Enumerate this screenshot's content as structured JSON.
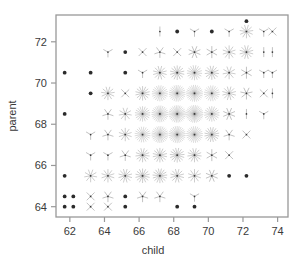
{
  "chart_data": {
    "type": "scatter",
    "variant": "sunflower-plot",
    "title": "",
    "xlabel": "child",
    "ylabel": "parent",
    "xlim": [
      61.2,
      74.6
    ],
    "ylim": [
      63.5,
      73.3
    ],
    "xticks": [
      62,
      64,
      66,
      68,
      70,
      72,
      74
    ],
    "xticklabels": [
      "62",
      "64",
      "66",
      "68",
      "70",
      "72",
      "74"
    ],
    "yticks": [
      64,
      66,
      68,
      70,
      72
    ],
    "yticklabels": [
      "64",
      "66",
      "68",
      "70",
      "72"
    ],
    "grid": false,
    "legend": null,
    "point_color": "#2b2b2b",
    "petal_color": "#8a8a8a",
    "frame_color": "#999999",
    "note": "Each location is drawn as a sunflower: count 1 = solid dot, count n>1 = n radiating petals.",
    "points": [
      {
        "x": 61.7,
        "y": 70.5,
        "count": 1
      },
      {
        "x": 61.7,
        "y": 68.5,
        "count": 1
      },
      {
        "x": 61.7,
        "y": 65.5,
        "count": 1
      },
      {
        "x": 61.7,
        "y": 64.5,
        "count": 1
      },
      {
        "x": 61.7,
        "y": 64.0,
        "count": 1
      },
      {
        "x": 62.2,
        "y": 64.5,
        "count": 1
      },
      {
        "x": 62.2,
        "y": 64.0,
        "count": 1
      },
      {
        "x": 63.2,
        "y": 70.5,
        "count": 1
      },
      {
        "x": 63.2,
        "y": 69.5,
        "count": 1
      },
      {
        "x": 63.2,
        "y": 67.5,
        "count": 3
      },
      {
        "x": 63.2,
        "y": 66.5,
        "count": 3
      },
      {
        "x": 63.2,
        "y": 65.5,
        "count": 9
      },
      {
        "x": 63.2,
        "y": 64.5,
        "count": 4
      },
      {
        "x": 63.2,
        "y": 64.0,
        "count": 4
      },
      {
        "x": 64.2,
        "y": 71.5,
        "count": 3
      },
      {
        "x": 64.2,
        "y": 69.5,
        "count": 11
      },
      {
        "x": 64.2,
        "y": 68.5,
        "count": 5
      },
      {
        "x": 64.2,
        "y": 67.5,
        "count": 5
      },
      {
        "x": 64.2,
        "y": 66.5,
        "count": 3
      },
      {
        "x": 64.2,
        "y": 65.5,
        "count": 10
      },
      {
        "x": 64.2,
        "y": 64.5,
        "count": 5
      },
      {
        "x": 64.2,
        "y": 64.0,
        "count": 4
      },
      {
        "x": 65.2,
        "y": 71.5,
        "count": 1
      },
      {
        "x": 65.2,
        "y": 70.5,
        "count": 1
      },
      {
        "x": 65.2,
        "y": 69.5,
        "count": 4
      },
      {
        "x": 65.2,
        "y": 68.5,
        "count": 9
      },
      {
        "x": 65.2,
        "y": 67.5,
        "count": 10
      },
      {
        "x": 65.2,
        "y": 66.5,
        "count": 5
      },
      {
        "x": 65.2,
        "y": 65.5,
        "count": 12
      },
      {
        "x": 65.2,
        "y": 64.5,
        "count": 1
      },
      {
        "x": 65.2,
        "y": 64.0,
        "count": 1
      },
      {
        "x": 66.2,
        "y": 71.5,
        "count": 4
      },
      {
        "x": 66.2,
        "y": 70.5,
        "count": 3
      },
      {
        "x": 66.2,
        "y": 69.5,
        "count": 14
      },
      {
        "x": 66.2,
        "y": 68.5,
        "count": 18
      },
      {
        "x": 66.2,
        "y": 67.5,
        "count": 20
      },
      {
        "x": 66.2,
        "y": 66.5,
        "count": 13
      },
      {
        "x": 66.2,
        "y": 65.5,
        "count": 14
      },
      {
        "x": 66.2,
        "y": 64.5,
        "count": 5
      },
      {
        "x": 67.2,
        "y": 72.5,
        "count": 2
      },
      {
        "x": 67.2,
        "y": 71.5,
        "count": 5
      },
      {
        "x": 67.2,
        "y": 70.5,
        "count": 12
      },
      {
        "x": 67.2,
        "y": 69.5,
        "count": 21
      },
      {
        "x": 67.2,
        "y": 68.5,
        "count": 25
      },
      {
        "x": 67.2,
        "y": 67.5,
        "count": 25
      },
      {
        "x": 67.2,
        "y": 66.5,
        "count": 14
      },
      {
        "x": 67.2,
        "y": 65.5,
        "count": 15
      },
      {
        "x": 67.2,
        "y": 64.5,
        "count": 5
      },
      {
        "x": 68.2,
        "y": 72.5,
        "count": 1
      },
      {
        "x": 68.2,
        "y": 71.5,
        "count": 4
      },
      {
        "x": 68.2,
        "y": 70.5,
        "count": 14
      },
      {
        "x": 68.2,
        "y": 69.5,
        "count": 24
      },
      {
        "x": 68.2,
        "y": 68.5,
        "count": 28
      },
      {
        "x": 68.2,
        "y": 67.5,
        "count": 26
      },
      {
        "x": 68.2,
        "y": 66.5,
        "count": 15
      },
      {
        "x": 68.2,
        "y": 65.5,
        "count": 12
      },
      {
        "x": 68.2,
        "y": 64.0,
        "count": 1
      },
      {
        "x": 69.2,
        "y": 72.5,
        "count": 3
      },
      {
        "x": 69.2,
        "y": 71.5,
        "count": 8
      },
      {
        "x": 69.2,
        "y": 70.5,
        "count": 17
      },
      {
        "x": 69.2,
        "y": 69.5,
        "count": 25
      },
      {
        "x": 69.2,
        "y": 68.5,
        "count": 29
      },
      {
        "x": 69.2,
        "y": 67.5,
        "count": 24
      },
      {
        "x": 69.2,
        "y": 66.5,
        "count": 13
      },
      {
        "x": 69.2,
        "y": 65.5,
        "count": 10
      },
      {
        "x": 69.2,
        "y": 64.5,
        "count": 3
      },
      {
        "x": 69.2,
        "y": 64.0,
        "count": 1
      },
      {
        "x": 70.2,
        "y": 72.5,
        "count": 1
      },
      {
        "x": 70.2,
        "y": 71.5,
        "count": 6
      },
      {
        "x": 70.2,
        "y": 70.5,
        "count": 13
      },
      {
        "x": 70.2,
        "y": 69.5,
        "count": 20
      },
      {
        "x": 70.2,
        "y": 68.5,
        "count": 18
      },
      {
        "x": 70.2,
        "y": 67.5,
        "count": 16
      },
      {
        "x": 70.2,
        "y": 66.5,
        "count": 6
      },
      {
        "x": 70.2,
        "y": 65.5,
        "count": 8
      },
      {
        "x": 71.2,
        "y": 72.5,
        "count": 3
      },
      {
        "x": 71.2,
        "y": 71.5,
        "count": 10
      },
      {
        "x": 71.2,
        "y": 70.5,
        "count": 9
      },
      {
        "x": 71.2,
        "y": 69.5,
        "count": 12
      },
      {
        "x": 71.2,
        "y": 68.5,
        "count": 8
      },
      {
        "x": 71.2,
        "y": 67.5,
        "count": 5
      },
      {
        "x": 71.2,
        "y": 66.5,
        "count": 4
      },
      {
        "x": 71.2,
        "y": 65.5,
        "count": 1
      },
      {
        "x": 72.2,
        "y": 73.0,
        "count": 1
      },
      {
        "x": 72.2,
        "y": 72.5,
        "count": 11
      },
      {
        "x": 72.2,
        "y": 71.5,
        "count": 12
      },
      {
        "x": 72.2,
        "y": 70.5,
        "count": 6
      },
      {
        "x": 72.2,
        "y": 69.5,
        "count": 7
      },
      {
        "x": 72.2,
        "y": 68.5,
        "count": 2
      },
      {
        "x": 72.2,
        "y": 67.5,
        "count": 4
      },
      {
        "x": 72.2,
        "y": 65.5,
        "count": 1
      },
      {
        "x": 73.2,
        "y": 72.5,
        "count": 3
      },
      {
        "x": 73.2,
        "y": 71.5,
        "count": 2
      },
      {
        "x": 73.2,
        "y": 70.5,
        "count": 3
      },
      {
        "x": 73.2,
        "y": 69.5,
        "count": 4
      },
      {
        "x": 73.2,
        "y": 68.5,
        "count": 3
      },
      {
        "x": 73.7,
        "y": 72.5,
        "count": 4
      },
      {
        "x": 73.7,
        "y": 71.5,
        "count": 2
      },
      {
        "x": 73.7,
        "y": 70.5,
        "count": 3
      },
      {
        "x": 73.7,
        "y": 69.5,
        "count": 2
      }
    ]
  }
}
